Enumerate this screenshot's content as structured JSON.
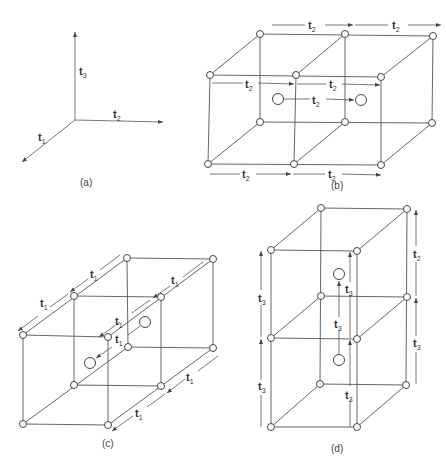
{
  "figure": {
    "panels": [
      {
        "id": "a",
        "caption": "(a)",
        "description": "Basis vectors t1, t2, t3"
      },
      {
        "id": "b",
        "caption": "(b)",
        "description": "Two cells stacked along t2 with face-centered points separated by t2"
      },
      {
        "id": "c",
        "caption": "(c)",
        "description": "Two cells stacked along t1 with interior points separated by t1"
      },
      {
        "id": "d",
        "caption": "(d)",
        "description": "Two cells stacked along t3 with interior points separated by t3"
      }
    ],
    "labels": {
      "t": "t",
      "sub1": "1",
      "sub2": "2",
      "sub3": "3"
    },
    "right_d_top_sub": "2"
  }
}
